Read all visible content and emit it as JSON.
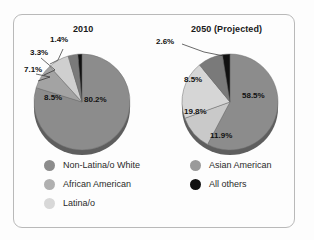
{
  "figure": {
    "background": "#fdfdfd",
    "frame_border_color": "#b9b9b9"
  },
  "chart_data": [
    {
      "type": "pie",
      "title": "2010",
      "categories": [
        "Non-Latina/o White",
        "African American",
        "Latina/o",
        "Asian American",
        "All others"
      ],
      "values": [
        80.2,
        8.5,
        7.1,
        3.3,
        1.4
      ],
      "labels": [
        "80.2%",
        "8.5%",
        "7.1%",
        "3.3%",
        "1.4%"
      ],
      "colors": [
        "#8c8c8c",
        "#a3a3a3",
        "#cfcfcf",
        "#7a7a7a",
        "#111111"
      ],
      "legend_position": "below"
    },
    {
      "type": "pie",
      "title": "2050 (Projected)",
      "categories": [
        "Non-Latina/o White",
        "Latina/o",
        "African American",
        "Asian American",
        "All others"
      ],
      "values": [
        58.5,
        11.9,
        19.8,
        8.5,
        2.6
      ],
      "labels": [
        "58.5%",
        "11.9%",
        "19.8%",
        "8.5%",
        "2.6%"
      ],
      "colors": [
        "#8c8c8c",
        "#c9c9c9",
        "#d6d6d6",
        "#7a7a7a",
        "#111111"
      ],
      "legend_position": "below"
    }
  ],
  "pies": {
    "left": {
      "title": "2010",
      "inside_labels": [
        {
          "text": "80.2%",
          "x": 62,
          "y": 72
        },
        {
          "text": "8.5%",
          "x": 22,
          "y": 70
        }
      ],
      "outside_labels": [
        {
          "text": "7.1%",
          "x": 2,
          "y": 42
        },
        {
          "text": "3.3%",
          "x": 8,
          "y": 25
        },
        {
          "text": "1.4%",
          "x": 28,
          "y": 12
        }
      ]
    },
    "right": {
      "title": "2050 (Projected)",
      "inside_labels": [
        {
          "text": "58.5%",
          "x": 90,
          "y": 68
        },
        {
          "text": "11.9%",
          "x": 58,
          "y": 108
        },
        {
          "text": "19.8%",
          "x": 32,
          "y": 84
        },
        {
          "text": "8.5%",
          "x": 32,
          "y": 52
        }
      ],
      "outside_labels": [
        {
          "text": "2.6%",
          "x": 4,
          "y": 14
        }
      ]
    }
  },
  "legend": {
    "left_column": [
      {
        "label": "Non-Latina/o White",
        "color": "#8c8c8c",
        "key": "non-latina-o-white"
      },
      {
        "label": "African American",
        "color": "#b0b0b0",
        "key": "african-american"
      },
      {
        "label": "Latina/o",
        "color": "#d8d8d8",
        "key": "latina-o"
      }
    ],
    "right_column": [
      {
        "label": "Asian American",
        "color": "#9a9a9a",
        "key": "asian-american"
      },
      {
        "label": "All others",
        "color": "#111111",
        "key": "all-others"
      }
    ]
  }
}
